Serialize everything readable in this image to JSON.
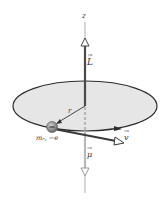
{
  "diagram": {
    "type": "orbital magnetic moment of electron",
    "labels": {
      "z_axis": "z",
      "angular_momentum": "L",
      "radius": "r",
      "velocity": "v",
      "magnetic_moment": "μ",
      "electron": "mₑ, −e"
    },
    "colors": {
      "disk_fill": "#e6e6e6",
      "disk_edge": "#2b2b2b",
      "L_vector": "#4a4a4a",
      "mu_vector": "#b8b8b8",
      "axis": "#9a9a9a",
      "electron": "#808080"
    }
  }
}
